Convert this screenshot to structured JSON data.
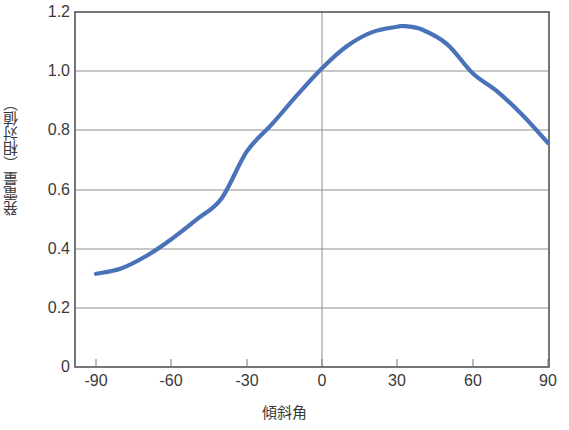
{
  "chart_data": {
    "type": "line",
    "title": "",
    "xlabel": "傾斜角",
    "ylabel": "発電量（相対値）",
    "xlim": [
      -90,
      90
    ],
    "ylim": [
      0,
      1.2
    ],
    "xticks": [
      "-90",
      "-60",
      "-30",
      "0",
      "30",
      "60",
      "90"
    ],
    "xtick_values": [
      -90,
      -60,
      -30,
      0,
      30,
      60,
      90
    ],
    "yticks": [
      "0",
      "0.2",
      "0.4",
      "0.6",
      "0.8",
      "1.0",
      "1.2"
    ],
    "ytick_values": [
      0,
      0.2,
      0.4,
      0.6,
      0.8,
      1.0,
      1.2
    ],
    "grid": "horizontal gridlines at every y tick, plus one vertical gridline at x = 0",
    "legend": "none",
    "series": [
      {
        "name": "発電量（相対値）",
        "color": "#4a72b8",
        "x": [
          -90,
          -80,
          -70,
          -60,
          -50,
          -40,
          -30,
          -20,
          -10,
          0,
          10,
          20,
          30,
          33,
          40,
          50,
          60,
          70,
          80,
          90
        ],
        "values": [
          0.315,
          0.333,
          0.375,
          0.432,
          0.498,
          0.57,
          0.728,
          0.82,
          0.918,
          1.01,
          1.085,
          1.132,
          1.15,
          1.152,
          1.14,
          1.09,
          0.993,
          0.93,
          0.85,
          0.757
        ]
      }
    ]
  },
  "axes": {
    "y_axis_title": "発電量（相対値）",
    "x_axis_title": "傾斜角"
  },
  "style": {
    "line_color": "#4a72b8",
    "grid_color": "#8f8f8f",
    "frame_color": "#555555",
    "background": "#ffffff",
    "text_color": "#3a3a3a"
  }
}
